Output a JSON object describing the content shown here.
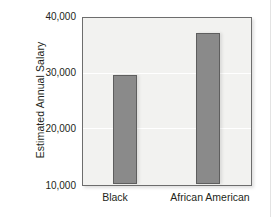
{
  "chart_data": {
    "type": "bar",
    "title": "",
    "subtitle": "",
    "xlabel": "",
    "ylabel": "Estimated Annual Salary",
    "categories": [
      "Black",
      "African American"
    ],
    "values": [
      29700,
      37300
    ],
    "series": [
      {
        "name": "Estimated Annual Salary",
        "values": [
          29700,
          37300
        ]
      }
    ],
    "ylim": [
      10000,
      40000
    ],
    "yticks": [
      10000,
      20000,
      30000,
      40000
    ],
    "ytick_labels": [
      "10,000",
      "20,000",
      "30,000",
      "40,000"
    ],
    "grid": true,
    "grid_axis": "y",
    "legend": false,
    "legend_position": "none",
    "bar_color": "#8a8a8a",
    "bar_edge_color": "#5e5e5e",
    "plot_background": "#f2f2f0",
    "gridline_color": "#ffffff",
    "axis_frame_color": "#6d6d6d",
    "text_color": "#231f20"
  },
  "axis": {
    "y_title": "Estimated Annual Salary",
    "y_tick_labels": [
      "40,000",
      "30,000",
      "20,000",
      "10,000"
    ],
    "x_tick_labels": [
      "Black",
      "African American"
    ]
  }
}
